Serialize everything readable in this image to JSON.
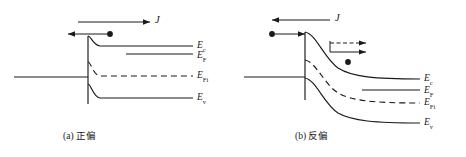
{
  "figure": {
    "type": "semiconductor-band-diagram",
    "background_color": "#ffffff",
    "line_color": "#1a1a1a"
  },
  "panels": [
    {
      "id": "panel-a",
      "caption": "(a) 正偏",
      "caption_label": "(a)",
      "caption_text": "正偏",
      "bias": "forward",
      "current_arrow": {
        "symbol": "J",
        "direction": "right",
        "style": "solid"
      },
      "carrier_arrow": {
        "direction": "left",
        "style": "solid",
        "carrier": "electron"
      },
      "band_labels": [
        {
          "symbol": "E",
          "sub": "c",
          "name": "conduction-band"
        },
        {
          "symbol": "E",
          "sub": "F",
          "name": "fermi-level"
        },
        {
          "symbol": "E",
          "sub": "Fi",
          "name": "intrinsic-fermi-level"
        },
        {
          "symbol": "E",
          "sub": "v",
          "name": "valence-band"
        }
      ]
    },
    {
      "id": "panel-b",
      "caption": "(b) 反偏",
      "caption_label": "(b)",
      "caption_text": "反偏",
      "bias": "reverse",
      "current_arrow": {
        "symbol": "J",
        "direction": "left",
        "style": "solid"
      },
      "carrier_arrow": {
        "direction": "right",
        "style": "solid",
        "carrier": "electron"
      },
      "secondary_arrows": {
        "dashed_direction": "right",
        "solid_direction": "right",
        "carrier": "hole"
      },
      "band_labels": [
        {
          "symbol": "E",
          "sub": "c",
          "name": "conduction-band"
        },
        {
          "symbol": "E",
          "sub": "F",
          "name": "fermi-level"
        },
        {
          "symbol": "E",
          "sub": "Fi",
          "name": "intrinsic-fermi-level"
        },
        {
          "symbol": "E",
          "sub": "v",
          "name": "valence-band"
        }
      ]
    }
  ],
  "labels": {
    "a_ec": "E",
    "a_ec_sub": "c",
    "a_ef": "E",
    "a_ef_sub": "F",
    "a_efi": "E",
    "a_efi_sub": "Fi",
    "a_ev": "E",
    "a_ev_sub": "v",
    "b_ec": "E",
    "b_ec_sub": "c",
    "b_ef": "E",
    "b_ef_sub": "F",
    "b_efi": "E",
    "b_efi_sub": "Fi",
    "b_ev": "E",
    "b_ev_sub": "v",
    "a_j": "J",
    "b_j": "J",
    "a_caption": "(a) 正偏",
    "b_caption": "(b) 反偏"
  }
}
